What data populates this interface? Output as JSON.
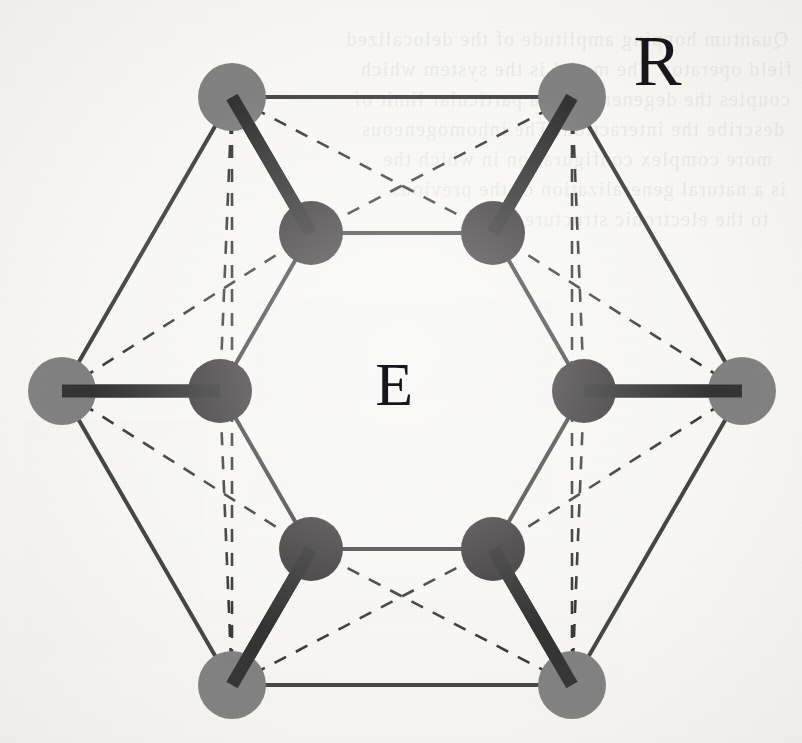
{
  "figure": {
    "kind": "molecular-structure-diagram",
    "background_color": "#f7f6f3",
    "center": {
      "x": 402,
      "y": 391
    },
    "labels": [
      {
        "id": "R",
        "text": "R",
        "x": 655,
        "y": 62,
        "font_size": 72,
        "meaning": "outer-shell-atom-label"
      },
      {
        "id": "E",
        "text": "E",
        "x": 395,
        "y": 391,
        "font_size": 62,
        "meaning": "inner-cage-label"
      }
    ],
    "colors": {
      "outer_node_fill": "#6f6f6f",
      "inner_node_fill": "#231f20",
      "thin_line": "#2b2b2b",
      "thick_bond": "#171717",
      "dashed_line": "#1e1e1e",
      "label_color": "#18161a"
    },
    "geometry": {
      "outer_radius_px": 340,
      "inner_radius_px": 182,
      "outer_node_r_px": 34,
      "inner_node_r_px": 32,
      "thin_line_width_px": 4,
      "thick_bond_width_px": 13,
      "dashed_line_width_px": 2.6,
      "dash_pattern": "13 11",
      "vertex_angles_deg": [
        180,
        240,
        300,
        0,
        60,
        120
      ]
    },
    "outer_nodes": [
      {
        "id": "R1",
        "label": "R",
        "angle_deg": 180,
        "x": 62,
        "y": 391,
        "r": 34,
        "position": "left"
      },
      {
        "id": "R2",
        "angle_deg": 240,
        "x": 232,
        "y": 97,
        "r": 34,
        "position": "top-left"
      },
      {
        "id": "R3",
        "angle_deg": 300,
        "x": 572,
        "y": 97,
        "r": 34,
        "position": "top-right"
      },
      {
        "id": "R4",
        "angle_deg": 0,
        "x": 742,
        "y": 391,
        "r": 34,
        "position": "right"
      },
      {
        "id": "R5",
        "angle_deg": 60,
        "x": 572,
        "y": 685,
        "r": 34,
        "position": "bottom-right"
      },
      {
        "id": "R6",
        "angle_deg": 120,
        "x": 232,
        "y": 685,
        "r": 34,
        "position": "bottom-left"
      }
    ],
    "inner_nodes": [
      {
        "id": "E1",
        "label": "E",
        "angle_deg": 180,
        "x": 220,
        "y": 391,
        "r": 32,
        "position": "left"
      },
      {
        "id": "E2",
        "angle_deg": 240,
        "x": 311,
        "y": 233,
        "r": 32,
        "position": "top-left"
      },
      {
        "id": "E3",
        "angle_deg": 300,
        "x": 493,
        "y": 233,
        "r": 32,
        "position": "top-right"
      },
      {
        "id": "E4",
        "angle_deg": 0,
        "x": 584,
        "y": 391,
        "r": 32,
        "position": "right"
      },
      {
        "id": "E5",
        "angle_deg": 60,
        "x": 493,
        "y": 549,
        "r": 32,
        "position": "bottom-right"
      },
      {
        "id": "E6",
        "angle_deg": 120,
        "x": 311,
        "y": 549,
        "r": 32,
        "position": "bottom-left"
      }
    ],
    "outer_edges": [
      [
        "R1",
        "R2"
      ],
      [
        "R2",
        "R3"
      ],
      [
        "R3",
        "R4"
      ],
      [
        "R4",
        "R5"
      ],
      [
        "R5",
        "R6"
      ],
      [
        "R6",
        "R1"
      ]
    ],
    "inner_edges": [
      [
        "E1",
        "E2"
      ],
      [
        "E2",
        "E3"
      ],
      [
        "E3",
        "E4"
      ],
      [
        "E4",
        "E5"
      ],
      [
        "E5",
        "E6"
      ],
      [
        "E6",
        "E1"
      ]
    ],
    "radial_bonds": [
      [
        "R1",
        "E1"
      ],
      [
        "R2",
        "E2"
      ],
      [
        "R3",
        "E3"
      ],
      [
        "R4",
        "E4"
      ],
      [
        "R5",
        "E5"
      ],
      [
        "R6",
        "E6"
      ]
    ],
    "dashed_edges": [
      [
        "R1",
        "E2"
      ],
      [
        "R1",
        "E6"
      ],
      [
        "R2",
        "E1"
      ],
      [
        "R2",
        "E3"
      ],
      [
        "R3",
        "E2"
      ],
      [
        "R3",
        "E4"
      ],
      [
        "R4",
        "E3"
      ],
      [
        "R4",
        "E5"
      ],
      [
        "R5",
        "E4"
      ],
      [
        "R5",
        "E6"
      ],
      [
        "R6",
        "E5"
      ],
      [
        "R6",
        "E1"
      ]
    ],
    "dashed_verticals": [
      {
        "from": "R2",
        "to": "R6",
        "note": "left vertical through top-left and bottom-left outer nodes"
      },
      {
        "from": "R3",
        "to": "R5",
        "note": "right vertical through top-right and bottom-right outer nodes"
      }
    ],
    "bleed_through_text": [
      {
        "x": 14,
        "y": 28,
        "text": "Quantum hopping  amplitude of the delocalized"
      },
      {
        "x": 10,
        "y": 58,
        "text": "field operator. The model is the system which"
      },
      {
        "x": 12,
        "y": 88,
        "text": "couples the degeneracy to a particular limit of"
      },
      {
        "x": 18,
        "y": 118,
        "text": "describe the interaction. The inhomogeneous"
      },
      {
        "x": 30,
        "y": 148,
        "text": "more complex configuration in which the"
      },
      {
        "x": 16,
        "y": 178,
        "text": "is a natural generalization of the previous"
      },
      {
        "x": 34,
        "y": 208,
        "text": "to the electronic structure."
      }
    ]
  }
}
